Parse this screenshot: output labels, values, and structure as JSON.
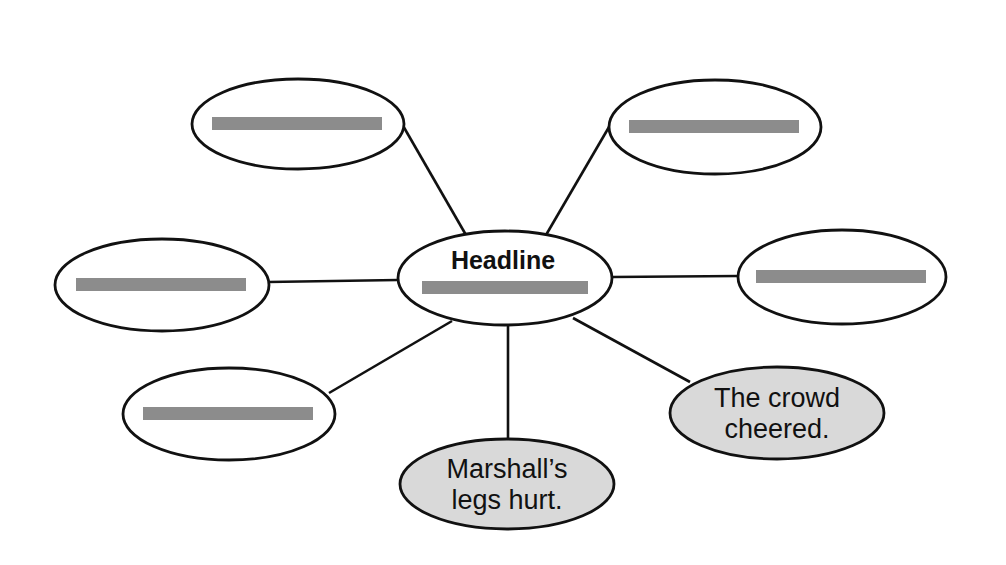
{
  "diagram": {
    "type": "word-web",
    "colors": {
      "stroke": "#111111",
      "blank_bar": "#8c8c8c",
      "filled_node": "#d9d9d9",
      "empty_node": "#ffffff",
      "background": "#ffffff"
    },
    "center": {
      "title": "Headline",
      "cx": 505,
      "cy": 278,
      "rx": 107,
      "ry": 47,
      "blank": true
    },
    "nodes": [
      {
        "id": "top-left",
        "cx": 298,
        "cy": 124,
        "rx": 106,
        "ry": 45,
        "blank": true,
        "text": [],
        "filled": false
      },
      {
        "id": "top-right",
        "cx": 715,
        "cy": 127,
        "rx": 106,
        "ry": 47,
        "blank": true,
        "text": [],
        "filled": false
      },
      {
        "id": "left",
        "cx": 162,
        "cy": 285,
        "rx": 107,
        "ry": 46,
        "blank": true,
        "text": [],
        "filled": false
      },
      {
        "id": "right",
        "cx": 842,
        "cy": 277,
        "rx": 104,
        "ry": 47,
        "blank": true,
        "text": [],
        "filled": false
      },
      {
        "id": "bottom-left",
        "cx": 229,
        "cy": 414,
        "rx": 106,
        "ry": 46,
        "blank": true,
        "text": [],
        "filled": false
      },
      {
        "id": "bottom-mid",
        "cx": 507,
        "cy": 484,
        "rx": 107,
        "ry": 45,
        "blank": false,
        "text": [
          "Marshall’s",
          "legs hurt."
        ],
        "filled": true
      },
      {
        "id": "bottom-right",
        "cx": 777,
        "cy": 413,
        "rx": 107,
        "ry": 46,
        "blank": false,
        "text": [
          "The crowd",
          "cheered."
        ],
        "filled": true
      }
    ],
    "edges": [
      {
        "from": "center",
        "to": "top-left",
        "x1": 466,
        "y1": 235,
        "x2": 402,
        "y2": 124
      },
      {
        "from": "center",
        "to": "top-right",
        "x1": 546,
        "y1": 235,
        "x2": 609,
        "y2": 127
      },
      {
        "from": "center",
        "to": "left",
        "x1": 398,
        "y1": 280,
        "x2": 268,
        "y2": 282
      },
      {
        "from": "center",
        "to": "right",
        "x1": 612,
        "y1": 277,
        "x2": 738,
        "y2": 276
      },
      {
        "from": "center",
        "to": "bottom-left",
        "x1": 452,
        "y1": 321,
        "x2": 329,
        "y2": 393
      },
      {
        "from": "center",
        "to": "bottom-mid",
        "x1": 508,
        "y1": 325,
        "x2": 508,
        "y2": 440
      },
      {
        "from": "center",
        "to": "bottom-right",
        "x1": 573,
        "y1": 318,
        "x2": 690,
        "y2": 382
      }
    ]
  }
}
